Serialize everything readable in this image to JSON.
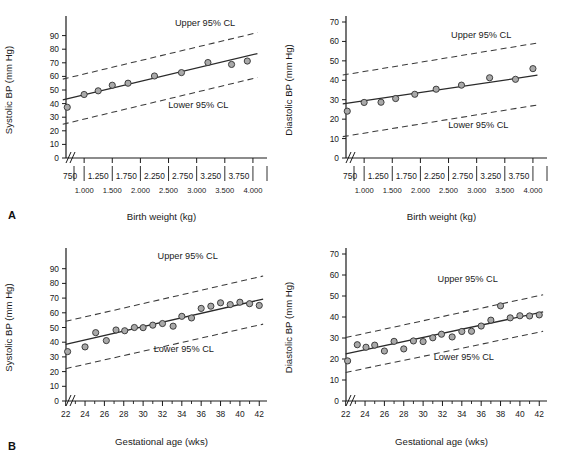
{
  "figure": {
    "panel_letters": {
      "a": "A",
      "b": "B"
    },
    "annotations": {
      "upper": "Upper 95% CL",
      "lower": "Lower 95% CL"
    },
    "colors": {
      "axis": "#1a1a1a",
      "fit_line": "#2a2a2a",
      "confidence_line": "#3a3a3a",
      "marker_fill": "#a9a9a9",
      "marker_stroke": "#303030",
      "background": "#ffffff"
    }
  },
  "chart_data": [
    {
      "id": "panel-a-systolic",
      "type": "scatter",
      "title": "",
      "xlabel": "Birth weight (kg)",
      "ylabel": "Systolic BP (mm Hg)",
      "xlim": [
        500,
        4250
      ],
      "ylim": [
        0,
        100
      ],
      "grid": false,
      "axis_break_x": true,
      "yticks": [
        0,
        10,
        20,
        30,
        40,
        50,
        60,
        70,
        80,
        90
      ],
      "yticklabels": [
        "0",
        "10",
        "20",
        "30",
        "40",
        "50",
        "60",
        "70",
        "80",
        "90"
      ],
      "xticks": [
        1000,
        1500,
        2000,
        2500,
        3000,
        3500,
        4000
      ],
      "xticklabels": [
        "1.000",
        "1.500",
        "2.000",
        "2.500",
        "3.000",
        "3.500",
        "4.000"
      ],
      "xbin_labels": [
        "750",
        "1.250",
        "1.750",
        "2.250",
        "2.750",
        "3.250",
        "3.750"
      ],
      "xbin_centers": [
        750,
        1250,
        1750,
        2250,
        2750,
        3250,
        3750
      ],
      "xbin_edges": [
        1000,
        1500,
        2000,
        2500,
        3000,
        3500,
        4000
      ],
      "x": [
        700,
        1000,
        1250,
        1500,
        1780,
        2250,
        2730,
        3200,
        3620,
        3900
      ],
      "y": [
        37.3,
        46.7,
        49.4,
        53.5,
        55.0,
        60.3,
        62.8,
        70.2,
        68.8,
        71.3
      ],
      "fit_line": {
        "x": [
          620,
          4080
        ],
        "y": [
          42.8,
          76.8
        ]
      },
      "upper_cl": {
        "x": [
          620,
          4080
        ],
        "y": [
          58.0,
          92.2
        ]
      },
      "lower_cl": {
        "x": [
          620,
          4080
        ],
        "y": [
          24.8,
          59.2
        ]
      },
      "annotations": [
        {
          "text": "Upper 95% CL",
          "x": 3150,
          "y": 97.0
        },
        {
          "text": "Lower 95% CL",
          "x": 3030,
          "y": 36.5
        }
      ]
    },
    {
      "id": "panel-a-diastolic",
      "type": "scatter",
      "title": "",
      "xlabel": "Birth weight (kg)",
      "ylabel": "Diastolic BP (mm Hg)",
      "xlim": [
        500,
        4250
      ],
      "ylim": [
        0,
        70
      ],
      "grid": false,
      "axis_break_x": true,
      "yticks": [
        0,
        10,
        20,
        30,
        40,
        50,
        60,
        70
      ],
      "yticklabels": [
        "0",
        "10",
        "20",
        "30",
        "40",
        "50",
        "60",
        "70"
      ],
      "xticks": [
        1000,
        1500,
        2000,
        2500,
        3000,
        3500,
        4000
      ],
      "xticklabels": [
        "1.000",
        "1.500",
        "2.000",
        "2.500",
        "3.000",
        "3.500",
        "4.000"
      ],
      "xbin_labels": [
        "750",
        "1.250",
        "1.750",
        "2.250",
        "2.750",
        "3.250",
        "3.750"
      ],
      "xbin_centers": [
        750,
        1250,
        1750,
        2250,
        2750,
        3250,
        3750
      ],
      "xbin_edges": [
        1000,
        1500,
        2000,
        2500,
        3000,
        3500,
        4000
      ],
      "x": [
        700,
        1000,
        1300,
        1560,
        1900,
        2280,
        2730,
        3230,
        3690,
        4000
      ],
      "y": [
        24.1,
        28.6,
        28.7,
        30.6,
        32.8,
        35.4,
        37.5,
        41.3,
        40.5,
        46.0
      ],
      "fit_line": {
        "x": [
          620,
          4080
        ],
        "y": [
          27.9,
          42.6
        ]
      },
      "upper_cl": {
        "x": [
          620,
          4080
        ],
        "y": [
          42.7,
          59.2
        ]
      },
      "lower_cl": {
        "x": [
          620,
          4080
        ],
        "y": [
          11.0,
          27.3
        ]
      },
      "annotations": [
        {
          "text": "Upper 95% CL",
          "x": 3080,
          "y": 62.0
        },
        {
          "text": "Lower 95% CL",
          "x": 3030,
          "y": 15.5
        }
      ]
    },
    {
      "id": "panel-b-systolic",
      "type": "scatter",
      "title": "",
      "xlabel": "Gestational age (wks)",
      "ylabel": "Systolic BP (mm Hg)",
      "xlim": [
        21,
        42.8
      ],
      "ylim": [
        0,
        100
      ],
      "grid": false,
      "axis_break_x": true,
      "yticks": [
        0,
        10,
        20,
        30,
        40,
        50,
        60,
        70,
        80,
        90
      ],
      "yticklabels": [
        "0",
        "10",
        "20",
        "30",
        "40",
        "50",
        "60",
        "70",
        "80",
        "90"
      ],
      "xticks": [
        22,
        23,
        24,
        25,
        26,
        27,
        28,
        29,
        30,
        31,
        32,
        33,
        34,
        35,
        36,
        37,
        38,
        39,
        40,
        41,
        42
      ],
      "xticklabels": [
        "22",
        "",
        "24",
        "",
        "26",
        "",
        "28",
        "",
        "30",
        "",
        "32",
        "",
        "34",
        "",
        "36",
        "",
        "38",
        "",
        "40",
        "",
        "42"
      ],
      "x": [
        22.2,
        24.0,
        25.1,
        26.2,
        27.2,
        28.1,
        29.1,
        30.0,
        31.0,
        32.0,
        33.1,
        34.0,
        35.0,
        36.0,
        37.0,
        38.0,
        39.0,
        40.0,
        41.0,
        42.0
      ],
      "y": [
        33.6,
        36.8,
        46.5,
        41.1,
        48.3,
        47.8,
        50.0,
        49.9,
        51.6,
        52.7,
        50.9,
        57.6,
        56.5,
        63.0,
        64.5,
        66.8,
        65.6,
        67.2,
        66.2,
        65.0
      ],
      "fit_line": {
        "x": [
          22.0,
          42.4
        ],
        "y": [
          38.5,
          69.3
        ]
      },
      "upper_cl": {
        "x": [
          22.0,
          42.4
        ],
        "y": [
          54.2,
          85.0
        ]
      },
      "lower_cl": {
        "x": [
          22.0,
          42.4
        ],
        "y": [
          22.0,
          52.3
        ]
      },
      "annotations": [
        {
          "text": "Upper 95% CL",
          "x": 34.6,
          "y": 96.5
        },
        {
          "text": "Lower 95% CL",
          "x": 34.2,
          "y": 33.5
        }
      ]
    },
    {
      "id": "panel-b-diastolic",
      "type": "scatter",
      "title": "",
      "xlabel": "Gestational age (wks)",
      "ylabel": "Diastolic BP (mm Hg)",
      "xlim": [
        21,
        42.8
      ],
      "ylim": [
        0,
        70
      ],
      "grid": false,
      "axis_break_x": true,
      "yticks": [
        0,
        10,
        20,
        30,
        40,
        50,
        60,
        70
      ],
      "yticklabels": [
        "0",
        "10",
        "20",
        "30",
        "40",
        "50",
        "60",
        "70"
      ],
      "xticks": [
        22,
        23,
        24,
        25,
        26,
        27,
        28,
        29,
        30,
        31,
        32,
        33,
        34,
        35,
        36,
        37,
        38,
        39,
        40,
        41,
        42
      ],
      "xticklabels": [
        "22",
        "",
        "24",
        "",
        "26",
        "",
        "28",
        "",
        "30",
        "",
        "32",
        "",
        "34",
        "",
        "36",
        "",
        "38",
        "",
        "40",
        "",
        "42"
      ],
      "x": [
        22.2,
        23.2,
        24.1,
        25.0,
        26.0,
        27.0,
        28.0,
        29.0,
        30.0,
        31.0,
        31.9,
        33.0,
        34.0,
        35.0,
        36.0,
        37.0,
        38.0,
        39.0,
        40.0,
        41.0,
        42.0
      ],
      "y": [
        19.1,
        26.8,
        25.6,
        26.6,
        23.8,
        28.4,
        24.8,
        28.6,
        28.3,
        30.1,
        31.8,
        30.5,
        33.1,
        33.2,
        35.7,
        38.5,
        45.3,
        39.6,
        40.6,
        40.5,
        41.0
      ],
      "fit_line": {
        "x": [
          22.0,
          42.4
        ],
        "y": [
          22.4,
          42.4
        ]
      },
      "upper_cl": {
        "x": [
          22.0,
          42.4
        ],
        "y": [
          30.2,
          50.6
        ]
      },
      "lower_cl": {
        "x": [
          22.0,
          42.4
        ],
        "y": [
          13.6,
          33.2
        ]
      },
      "annotations": [
        {
          "text": "Upper 95% CL",
          "x": 34.6,
          "y": 56.5
        },
        {
          "text": "Lower 95% CL",
          "x": 34.2,
          "y": 19.5
        }
      ]
    }
  ]
}
